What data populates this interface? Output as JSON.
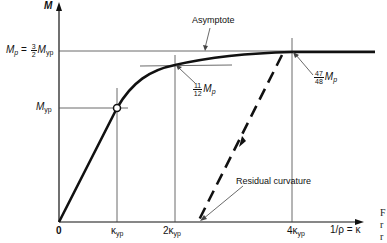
{
  "diagram": {
    "type": "moment-curvature",
    "y_axis_label": "M",
    "x_axis_label": "1/ρ = κ",
    "origin_label": "0",
    "y_ticks": {
      "mp": {
        "lhs": "M",
        "lhs_sub": "p",
        "eq": "=",
        "num": "3",
        "den": "2",
        "rhs": "M",
        "rhs_sub": "yp"
      },
      "myp": {
        "text": "M",
        "sub": "yp"
      }
    },
    "x_ticks": [
      {
        "prefix": "",
        "text": "κ",
        "sub": "yp"
      },
      {
        "prefix": "2",
        "text": "κ",
        "sub": "yp"
      },
      {
        "prefix": "4",
        "text": "κ",
        "sub": "yp"
      }
    ],
    "annotations": {
      "asymptote": "Asymptote",
      "point_11_12": {
        "num": "11",
        "den": "12",
        "text": "M",
        "sub": "p"
      },
      "point_47_48": {
        "num": "47",
        "den": "48",
        "text": "M",
        "sub": "p"
      },
      "residual": "Residual curvature"
    },
    "side_text": [
      "F",
      "r",
      "r"
    ],
    "colors": {
      "line": "#111111",
      "thin": "#444444",
      "background": "#ffffff"
    }
  }
}
